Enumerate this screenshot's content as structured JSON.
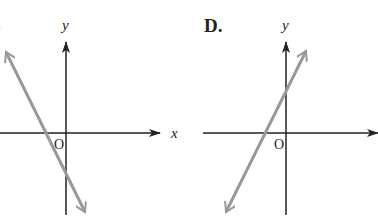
{
  "panels": [
    {
      "label": "C.",
      "label_visible": ".",
      "x_axis_label": "x",
      "y_axis_label": "y",
      "origin_label": "O",
      "line": {
        "slope": "negative",
        "description": "line with negative slope, x-intercept negative, y-intercept negative",
        "color": "#999999"
      }
    },
    {
      "label": "D.",
      "x_axis_label": "x",
      "y_axis_label": "y",
      "origin_label": "O",
      "line": {
        "slope": "positive",
        "description": "line with positive slope, x-intercept negative, y-intercept positive",
        "color": "#999999"
      }
    }
  ],
  "colors": {
    "axis": "#222222",
    "line": "#999999",
    "background": "#ffffff"
  }
}
